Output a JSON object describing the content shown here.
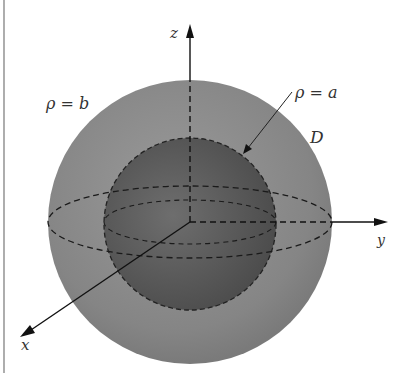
{
  "figure": {
    "labels": {
      "outer_sphere": "ρ = b",
      "inner_sphere": "ρ = a",
      "region": "D",
      "x_axis": "x",
      "y_axis": "y",
      "z_axis": "z"
    },
    "colors": {
      "background": "#ffffff",
      "outer_shell": "#8a8a8a",
      "inner_sphere": "#5c5c5c",
      "lines": "#1a1a1a"
    }
  }
}
